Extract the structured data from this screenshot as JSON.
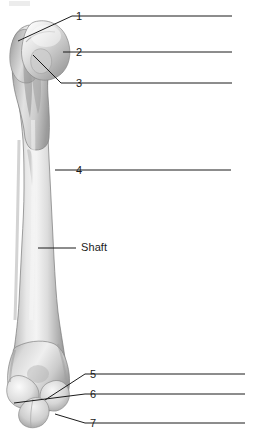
{
  "figure": {
    "view_label": "",
    "background_color": "#ffffff",
    "line_color": "#1b1b1b",
    "bone_light": "#f2f2f2",
    "bone_mid": "#c9c9c9",
    "bone_dark": "#8e8e8e",
    "bone_outline": "#6f6f6f"
  },
  "labels": [
    {
      "id": "label-1",
      "text": "1",
      "x": 76,
      "y": 11
    },
    {
      "id": "label-2",
      "text": "2",
      "x": 76,
      "y": 47
    },
    {
      "id": "label-3",
      "text": "3",
      "x": 76,
      "y": 78
    },
    {
      "id": "label-4",
      "text": "4",
      "x": 76,
      "y": 165
    },
    {
      "id": "label-shaft",
      "text": "Shaft",
      "x": 81,
      "y": 242
    },
    {
      "id": "label-5",
      "text": "5",
      "x": 90,
      "y": 369
    },
    {
      "id": "label-6",
      "text": "6",
      "x": 90,
      "y": 389
    },
    {
      "id": "label-7",
      "text": "7",
      "x": 90,
      "y": 418
    }
  ],
  "leader_lines": [
    {
      "id": "leader-1",
      "points": "18,41 72,16 88,16 232,16"
    },
    {
      "id": "leader-2",
      "points": "63,52 72,52 88,52 232,52"
    },
    {
      "id": "leader-3",
      "points": "33,55 61,83 72,83 88,83 232,83"
    },
    {
      "id": "leader-4",
      "points": "55,170 72,170 88,170 231,170"
    },
    {
      "id": "leader-shaft",
      "points": "38,248 76,248"
    },
    {
      "id": "leader-5",
      "points": "45,400 85,374 102,374 245,374"
    },
    {
      "id": "leader-6",
      "points": "14,403 85,394 102,394 245,394"
    },
    {
      "id": "leader-7",
      "points": "55,414 85,423 102,423 245,423"
    }
  ]
}
